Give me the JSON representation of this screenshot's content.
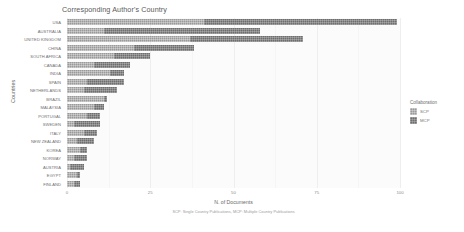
{
  "chart_data": {
    "type": "bar",
    "orientation": "horizontal",
    "stacked": true,
    "title": "Corresponding Author's Country",
    "subtitle": "",
    "xlabel": "N. of Documents",
    "ylabel": "Countries",
    "caption": "SCP: Single Country Publications, MCP: Multiple Country Publications",
    "grid": true,
    "legend_position": "right",
    "legend_title": "Collaboration",
    "xlim": [
      0,
      100
    ],
    "xticks": [
      0,
      25,
      50,
      75,
      100
    ],
    "xtick_labels": [
      "0",
      "25",
      "50",
      "75",
      "100"
    ],
    "categories": [
      "USA",
      "AUSTRALIA",
      "UNITED KINGDOM",
      "CHINA",
      "SOUTH AFRICA",
      "CANADA",
      "INDIA",
      "SPAIN",
      "NETHERLANDS",
      "BRAZIL",
      "MALAYSIA",
      "PORTUGAL",
      "SWEDEN",
      "ITALY",
      "NEW ZEALAND",
      "KOREA",
      "NORWAY",
      "AUSTRIA",
      "EGYPT",
      "FINLAND"
    ],
    "series": [
      {
        "name": "SCP",
        "color": "#9a9a9a",
        "values": [
          41,
          11,
          37,
          20,
          14,
          8,
          13,
          6,
          5,
          11,
          8,
          6,
          2,
          5,
          3,
          4,
          2,
          1,
          3,
          2
        ]
      },
      {
        "name": "MCP",
        "color": "#6e6e6e",
        "values": [
          58,
          47,
          34,
          18,
          11,
          11,
          4,
          11,
          10,
          1,
          3,
          4,
          8,
          4,
          5,
          2,
          4,
          4,
          1,
          2
        ]
      }
    ],
    "totals": [
      99,
      58,
      71,
      38,
      25,
      19,
      17,
      17,
      15,
      12,
      11,
      10,
      10,
      9,
      8,
      6,
      6,
      5,
      4,
      4
    ]
  },
  "legend": {
    "title": "Collaboration",
    "items": [
      {
        "label": "SCP",
        "color": "#9a9a9a"
      },
      {
        "label": "MCP",
        "color": "#6e6e6e"
      }
    ]
  }
}
